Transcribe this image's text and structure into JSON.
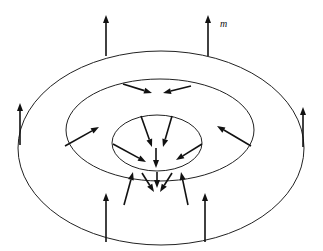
{
  "figure": {
    "type": "magnetization-vector-field diagram",
    "colors": {
      "line": "#222222",
      "arrow": "#111111",
      "background": "#ffffff"
    },
    "labels": {
      "vector": "m"
    },
    "rings": [
      {
        "name": "outer",
        "cx": 161,
        "cy": 148,
        "rx": 143,
        "ry": 97
      },
      {
        "name": "middle",
        "cx": 160,
        "cy": 130,
        "rx": 94,
        "ry": 51
      },
      {
        "name": "inner",
        "cx": 157,
        "cy": 143,
        "rx": 45,
        "ry": 28
      }
    ],
    "arrows": [
      {
        "ring": "outer",
        "position": "top-left",
        "from": [
          106,
          56
        ],
        "to": [
          106,
          15
        ]
      },
      {
        "ring": "outer",
        "position": "top-right",
        "from": [
          208,
          56
        ],
        "to": [
          208,
          15
        ]
      },
      {
        "ring": "outer",
        "position": "left",
        "from": [
          20,
          145
        ],
        "to": [
          20,
          103
        ]
      },
      {
        "ring": "outer",
        "position": "right",
        "from": [
          303,
          147
        ],
        "to": [
          303,
          107
        ]
      },
      {
        "ring": "outer",
        "position": "bottom-left",
        "from": [
          106,
          242
        ],
        "to": [
          106,
          193
        ]
      },
      {
        "ring": "outer",
        "position": "bottom-right",
        "from": [
          205,
          242
        ],
        "to": [
          205,
          193
        ]
      },
      {
        "ring": "middle",
        "position": "top-left",
        "from": [
          123,
          84
        ],
        "to": [
          152,
          93
        ]
      },
      {
        "ring": "middle",
        "position": "top-right",
        "from": [
          191,
          86
        ],
        "to": [
          163,
          93
        ]
      },
      {
        "ring": "middle",
        "position": "left",
        "from": [
          65,
          146
        ],
        "to": [
          99,
          127
        ]
      },
      {
        "ring": "middle",
        "position": "right",
        "from": [
          251,
          146
        ],
        "to": [
          217,
          126
        ]
      },
      {
        "ring": "middle",
        "position": "bottom-left",
        "from": [
          124,
          205
        ],
        "to": [
          133,
          172
        ]
      },
      {
        "ring": "middle",
        "position": "bottom-right",
        "from": [
          188,
          205
        ],
        "to": [
          181,
          172
        ]
      },
      {
        "ring": "inner",
        "position": "top-left",
        "from": [
          141,
          116
        ],
        "to": [
          152,
          147
        ]
      },
      {
        "ring": "inner",
        "position": "top-right",
        "from": [
          172,
          116
        ],
        "to": [
          163,
          147
        ]
      },
      {
        "ring": "inner",
        "position": "left",
        "from": [
          113,
          144
        ],
        "to": [
          146,
          162
        ]
      },
      {
        "ring": "inner",
        "position": "right",
        "from": [
          202,
          144
        ],
        "to": [
          176,
          160
        ]
      },
      {
        "ring": "inner",
        "position": "center",
        "from": [
          156,
          148
        ],
        "to": [
          156,
          168
        ]
      },
      {
        "ring": "inner",
        "position": "bottom-left",
        "from": [
          142,
          173
        ],
        "to": [
          154,
          192
        ]
      },
      {
        "ring": "inner",
        "position": "bottom-right",
        "from": [
          172,
          173
        ],
        "to": [
          160,
          192
        ]
      },
      {
        "ring": "inner",
        "position": "bottom-center",
        "from": [
          157,
          172
        ],
        "to": [
          157,
          188
        ]
      }
    ]
  }
}
